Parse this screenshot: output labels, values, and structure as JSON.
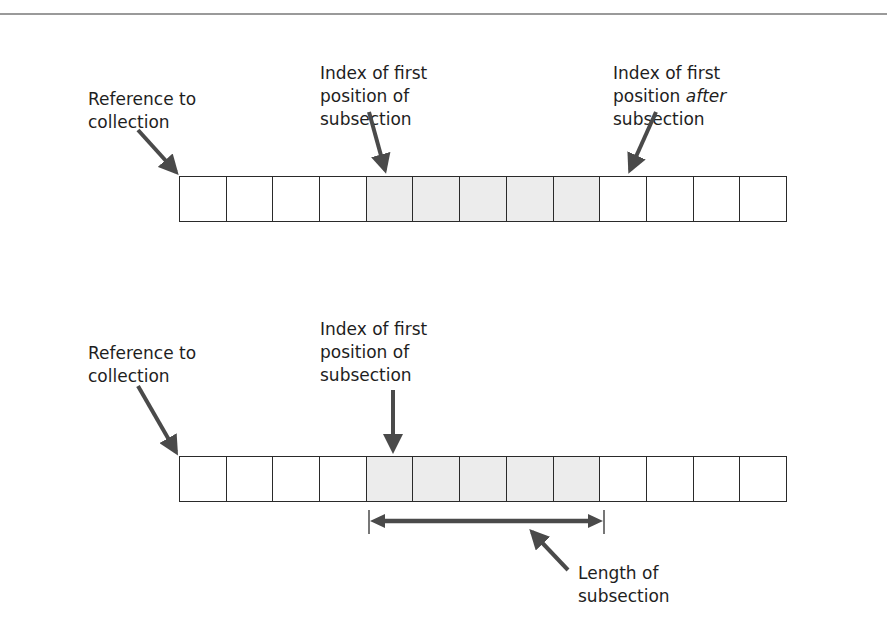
{
  "diagram": {
    "colors": {
      "rule": "#9a9a9a",
      "arrow": "#4a4a4a",
      "cell_border": "#2a2a2a",
      "shaded_cell": "#ececec"
    },
    "top": {
      "labels": {
        "reference": "Reference to\ncollection",
        "first_index": "Index of first\nposition of\nsubsection",
        "after_index_line1": "Index of first",
        "after_index_line2_pre": "position ",
        "after_index_line2_italic": "after",
        "after_index_line3": "subsection"
      },
      "cell_count": 13,
      "shaded_cells": [
        4,
        5,
        6,
        7,
        8
      ]
    },
    "bottom": {
      "labels": {
        "reference": "Reference to\ncollection",
        "first_index": "Index of first\nposition of\nsubsection",
        "length": "Length of\nsubsection"
      },
      "cell_count": 13,
      "shaded_cells": [
        4,
        5,
        6,
        7,
        8
      ]
    }
  }
}
